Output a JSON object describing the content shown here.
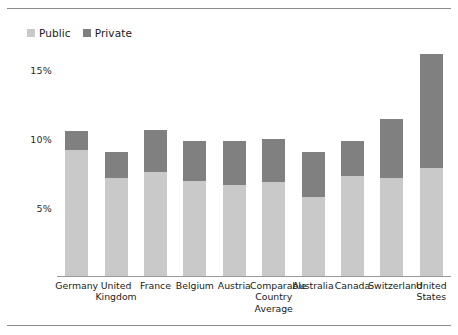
{
  "chart_data": {
    "type": "bar",
    "subtype": "stacked-bar",
    "title": "",
    "subtitle": "",
    "xlabel": "",
    "ylabel": "",
    "categories": [
      "Germany",
      "United Kingdom",
      "France",
      "Belgium",
      "Austria",
      "Comparable Country Average",
      "Australia",
      "Canada",
      "Switzerland",
      "United States"
    ],
    "series": [
      {
        "name": "Public",
        "color": "#c9c9c9",
        "values": [
          9.2,
          7.2,
          7.6,
          7.0,
          6.7,
          6.9,
          5.8,
          7.3,
          7.2,
          7.9
        ]
      },
      {
        "name": "Private",
        "color": "#808080",
        "values": [
          1.4,
          1.9,
          3.1,
          2.9,
          3.2,
          3.1,
          3.3,
          2.6,
          4.3,
          8.3
        ]
      }
    ],
    "totals": [
      10.6,
      9.1,
      10.7,
      9.9,
      9.9,
      10.0,
      9.1,
      9.9,
      11.5,
      16.2
    ],
    "ylim": [
      0,
      17
    ],
    "yticks": [
      5,
      10,
      15
    ],
    "ytick_labels": [
      "5%",
      "10%",
      "15%"
    ],
    "grid": false,
    "legend_position": "top-left",
    "value_unit": "%"
  },
  "legend": {
    "items": [
      {
        "label": "Public",
        "color": "#c9c9c9",
        "icon": "square-swatch-icon"
      },
      {
        "label": "Private",
        "color": "#808080",
        "icon": "square-swatch-icon"
      }
    ]
  },
  "axes": {
    "y": {
      "ticks": [
        {
          "label": "15%",
          "value": 15
        },
        {
          "label": "10%",
          "value": 10
        },
        {
          "label": "5%",
          "value": 5
        }
      ]
    },
    "x": {
      "labels": [
        "Germany",
        "United Kingdom",
        "France",
        "Belgium",
        "Austria",
        "Comparable Country Average",
        "Australia",
        "Canada",
        "Switzerland",
        "United States"
      ]
    }
  }
}
